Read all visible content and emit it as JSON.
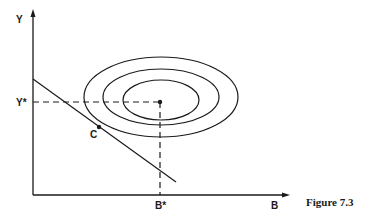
{
  "figure": {
    "caption": "Figure 7.3",
    "axes": {
      "x_label": "B",
      "y_label": "Y"
    },
    "optimum": {
      "x_label": "B*",
      "y_label": "Y*"
    },
    "tangency_point": {
      "label": "C"
    },
    "colors": {
      "ink": "#1a1a1a",
      "background": "#ffffff"
    }
  }
}
